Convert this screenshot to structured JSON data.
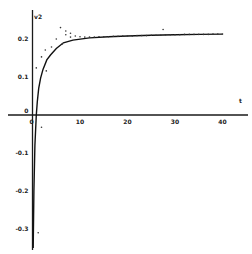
{
  "chart_data": {
    "type": "scatter",
    "title": "",
    "xlabel": "t",
    "ylabel": "v2",
    "xlim": [
      -6,
      45
    ],
    "ylim": [
      -0.35,
      0.24
    ],
    "grid": false,
    "legend": null,
    "x_ticks": [
      0,
      10,
      20,
      30,
      40
    ],
    "x_tick_labels": [
      "0",
      "10",
      "20",
      "30",
      "40"
    ],
    "y_ticks": [
      0.2,
      0.1,
      0,
      -0.1,
      -0.2,
      -0.3
    ],
    "y_tick_labels": [
      "0.2",
      "0.1",
      "0",
      "-0.1",
      "-0.2",
      "-0.3"
    ],
    "series": [
      {
        "name": "fitted curve",
        "kind": "line",
        "x": [
          0.15,
          0.3,
          0.5,
          0.8,
          1.0,
          1.3,
          1.7,
          2.2,
          3.0,
          3.8,
          5.0,
          6.5,
          8.5,
          12,
          16,
          20,
          25,
          30,
          35,
          40
        ],
        "y": [
          -0.35,
          -0.2,
          -0.08,
          0.0,
          0.035,
          0.07,
          0.097,
          0.12,
          0.145,
          0.158,
          0.175,
          0.19,
          0.197,
          0.203,
          0.206,
          0.208,
          0.21,
          0.211,
          0.212,
          0.213
        ]
      },
      {
        "name": "data points",
        "kind": "scatter",
        "x": [
          1.2,
          1.9,
          0.8,
          1.9,
          2.7,
          2.9,
          4.0,
          5.0,
          5.9,
          6.3,
          7.0,
          7.0,
          8.0,
          8.0,
          9.0,
          10.0,
          11.0,
          12.0,
          13.0,
          14.0,
          15.0,
          16.0,
          17.0,
          18.0,
          19.0,
          20.0,
          21.0,
          22.0,
          23.0,
          24.0,
          25.0,
          26.0,
          27.0,
          27.5,
          28.0,
          29.0,
          30.0,
          31.0,
          32.0,
          33.0,
          34.0,
          35.0,
          36.0,
          37.0,
          38.0,
          39.0,
          40.0
        ],
        "y": [
          -0.31,
          -0.032,
          0.124,
          0.153,
          0.171,
          0.116,
          0.179,
          0.2,
          0.23,
          0.187,
          0.221,
          0.211,
          0.215,
          0.205,
          0.208,
          0.206,
          0.205,
          0.205,
          0.205,
          0.206,
          0.206,
          0.206,
          0.207,
          0.207,
          0.208,
          0.208,
          0.208,
          0.209,
          0.209,
          0.209,
          0.21,
          0.21,
          0.21,
          0.225,
          0.211,
          0.211,
          0.211,
          0.211,
          0.212,
          0.212,
          0.212,
          0.212,
          0.212,
          0.212,
          0.213,
          0.213,
          0.213
        ]
      }
    ]
  },
  "layout": {
    "origin_px": [
      32.5,
      115
    ],
    "px_per_x_unit": 4.75,
    "px_per_y_unit": 380,
    "x_axis_extent_px": [
      8,
      248
    ],
    "y_axis_extent_px": [
      10,
      250
    ],
    "xlabel_px": [
      239,
      103
    ],
    "ylabel_px": [
      34,
      19
    ]
  },
  "colors": {
    "axis": "#1a1a1a",
    "curve": "#111111",
    "points": "#333333",
    "background": "#ffffff"
  }
}
